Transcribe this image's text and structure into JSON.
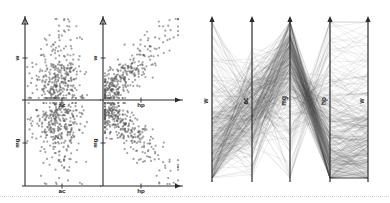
{
  "figure": {
    "title": "",
    "background_color": "#ffffff",
    "ink_color": "#2b2b2b",
    "width": 390,
    "height": 203
  },
  "chart_data": [
    {
      "type": "scatter",
      "name": "scatter-matrix",
      "title": "",
      "panel_position": "left",
      "grid": false,
      "legend": null,
      "variables": [
        "w",
        "ac",
        "mg",
        "hp"
      ],
      "subplots": [
        {
          "id": "w-vs-ac",
          "quadrant": "top-left",
          "xlabel": "ac",
          "ylabel": "w",
          "xlim": [
            0,
            1
          ],
          "ylim": [
            0,
            1
          ],
          "correlation": "weak-negative",
          "n_points": 330,
          "cluster_center": [
            0.42,
            0.33
          ],
          "cluster_spread": [
            0.2,
            0.22
          ],
          "point_color": "#555555",
          "point_size": 1.1
        },
        {
          "id": "w-vs-hp",
          "quadrant": "top-right",
          "xlabel": "hp",
          "ylabel": "w",
          "xlim": [
            0,
            1
          ],
          "ylim": [
            0,
            1
          ],
          "correlation": "strong-positive",
          "n_points": 330,
          "cluster_center": [
            0.34,
            0.33
          ],
          "cluster_spread": [
            0.22,
            0.22
          ],
          "point_color": "#555555",
          "point_size": 1.1
        },
        {
          "id": "mg-vs-ac",
          "quadrant": "bottom-left",
          "xlabel": "ac",
          "ylabel": "mg",
          "xlim": [
            0,
            1
          ],
          "ylim": [
            0,
            1
          ],
          "correlation": "weak-positive",
          "n_points": 330,
          "cluster_center": [
            0.45,
            0.48
          ],
          "cluster_spread": [
            0.17,
            0.22
          ],
          "point_color": "#555555",
          "point_size": 1.1
        },
        {
          "id": "mg-vs-hp",
          "quadrant": "bottom-right",
          "xlabel": "hp",
          "ylabel": "mg",
          "xlim": [
            0,
            1
          ],
          "ylim": [
            0,
            1
          ],
          "correlation": "strong-negative",
          "n_points": 330,
          "cluster_center": [
            0.28,
            0.55
          ],
          "cluster_spread": [
            0.2,
            0.22
          ],
          "point_color": "#555555",
          "point_size": 1.1
        }
      ]
    },
    {
      "type": "line",
      "name": "parallel-coordinates",
      "title": "",
      "panel_position": "right",
      "grid": false,
      "legend": null,
      "axes": [
        "w",
        "ac",
        "mg",
        "hp",
        "w"
      ],
      "n_lines": 330,
      "line_color": "#4a4a4a",
      "line_opacity": 0.16,
      "axis_ranges": [
        [
          0,
          1
        ],
        [
          0,
          1
        ],
        [
          0,
          1
        ],
        [
          0,
          1
        ],
        [
          0,
          1
        ]
      ]
    }
  ],
  "scatter": {
    "labels": {
      "w": "w",
      "ac": "ac",
      "mg": "mg",
      "hp": "hp"
    },
    "top_left": {
      "xlabel": "ac",
      "ylabel": "w"
    },
    "top_right": {
      "xlabel": "hp",
      "ylabel": "w"
    },
    "bottom_left": {
      "xlabel": "ac",
      "ylabel": "mg"
    },
    "bottom_right": {
      "xlabel": "hp",
      "ylabel": "mg"
    }
  },
  "parallel": {
    "axis_labels": [
      "w",
      "ac",
      "mg",
      "hp",
      "w"
    ]
  }
}
